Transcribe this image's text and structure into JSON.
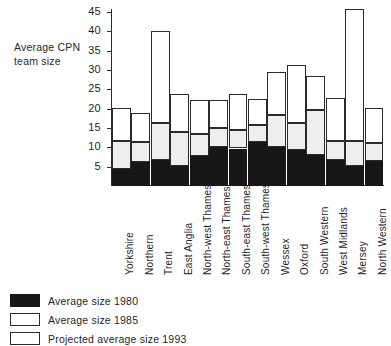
{
  "chart_data": {
    "type": "bar",
    "subtype": "stacked-bar",
    "title": "",
    "ylabel": "Average CPN team size",
    "xlabel": "",
    "ylim": [
      0,
      45.8
    ],
    "yticks": [
      5,
      10,
      15,
      20,
      25,
      30,
      35,
      40,
      45
    ],
    "grid": false,
    "legend_position": "bottom-left",
    "stacked": true,
    "categories": [
      "Yorkshire",
      "Northern",
      "Trent",
      "East Anglia",
      "North-west Thames",
      "North-east Thames",
      "South-east Thames",
      "South-west Thames",
      "Wessex",
      "Oxford",
      "South Western",
      "West Midlands",
      "Mersey",
      "North Western"
    ],
    "series": [
      {
        "name": "Average size 1980",
        "color": "#171717",
        "values": [
          4.3,
          6.2,
          6.7,
          5.2,
          7.8,
          10.0,
          9.7,
          11.3,
          10.0,
          9.3,
          8.0,
          6.6,
          5.2,
          6.5
        ]
      },
      {
        "name": "Average size 1985",
        "color": "#eeeeee",
        "values": [
          11.7,
          11.4,
          16.2,
          14.0,
          13.4,
          15.0,
          14.6,
          15.8,
          18.4,
          16.4,
          19.7,
          11.7,
          11.6,
          11.2
        ]
      },
      {
        "name": "Projected average size 1993",
        "color": "#ffffff",
        "values": [
          20.3,
          18.9,
          40.2,
          23.7,
          22.2,
          22.3,
          23.7,
          22.4,
          29.4,
          31.2,
          28.4,
          22.9,
          45.8,
          20.3
        ]
      }
    ]
  },
  "legend": {
    "items": [
      {
        "label": "Average size 1980",
        "swatch": "filled-black"
      },
      {
        "label": "Average size 1985",
        "swatch": "outlined-white"
      },
      {
        "label": "Projected average size 1993",
        "swatch": "outlined-white"
      }
    ]
  }
}
